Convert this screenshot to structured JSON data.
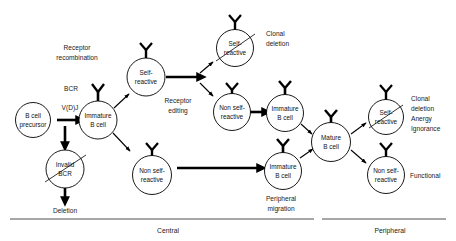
{
  "figure": {
    "background_color": "#ffffff",
    "stroke_color": "#000000",
    "width": 456,
    "height": 241
  },
  "nodes": {
    "b_cell_precursor": {
      "line1": "B cell",
      "line2": "precursor"
    },
    "immature_b_cell_central": {
      "line1": "Immature",
      "line2": "B cell"
    },
    "invalid_bcr": {
      "line1": "Invalid",
      "line2": "BCR"
    },
    "self_reactive_central": {
      "line1": "Self-",
      "line2": "reactive"
    },
    "non_self_reactive_central_lower": {
      "line1": "Non self-",
      "line2": "reactive"
    },
    "self_reactive_deleted": {
      "line1": "Self-",
      "line2": "reactive"
    },
    "non_self_reactive_edited": {
      "line1": "Non self-",
      "line2": "reactive"
    },
    "immature_b_cell_upper_right": {
      "line1": "Immature",
      "line2": "B cell"
    },
    "immature_b_cell_lower_right": {
      "line1": "Immature",
      "line2": "B cell"
    },
    "mature_b_cell": {
      "line1": "Mature",
      "line2": "B cell"
    },
    "self_reactive_peripheral": {
      "line1": "Self-",
      "line2": "reactive"
    },
    "non_self_reactive_peripheral": {
      "line1": "Non self-",
      "line2": "reactive"
    }
  },
  "annotations": {
    "receptor_recombination": {
      "line1": "Receptor",
      "line2": "recombination"
    },
    "bcr": "BCR",
    "vdj": "V(D)J",
    "deletion": "Deletion",
    "receptor_editing": {
      "line1": "Receptor",
      "line2": "editing"
    },
    "clonal_deletion_top": {
      "line1": "Clonal",
      "line2": "deletion"
    },
    "peripheral_migration": {
      "line1": "Peripheral",
      "line2": "migration"
    },
    "clonal_deletion_anergy_ignorance": {
      "line1": "Clonal",
      "line2": "deletion",
      "line3": "Anergy",
      "line4": "Ignorance"
    },
    "functional": "Functional"
  },
  "compartments": {
    "central": "Central",
    "peripheral": "Peripheral"
  }
}
